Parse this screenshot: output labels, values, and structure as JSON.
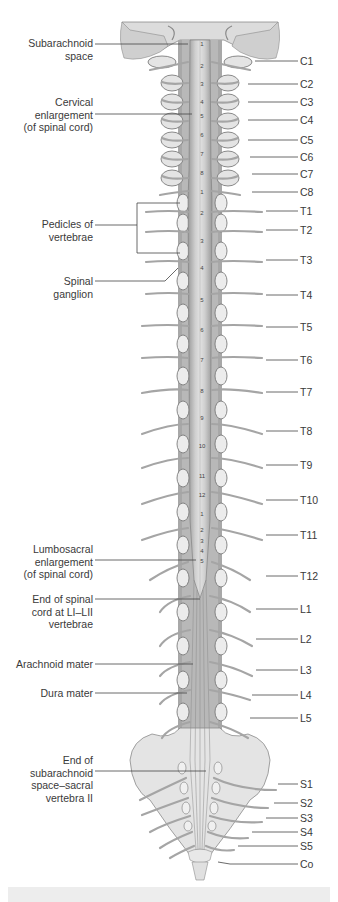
{
  "figure": {
    "colors": {
      "bone": "#e6e6e6",
      "bone_outline": "#8c8c8c",
      "cord": "#c9c9c9",
      "nerve": "#b5b5b5",
      "leader_line": "#444444",
      "bottom_bar": "#ededed"
    },
    "left_labels": [
      {
        "id": "subarachnoid-space",
        "lines": [
          "Subarachnoid",
          "space"
        ]
      },
      {
        "id": "cervical-enlargement",
        "lines": [
          "Cervical",
          "enlargement",
          "(of spinal cord)"
        ]
      },
      {
        "id": "pedicles-of-vertebrae",
        "lines": [
          "Pedicles of",
          "vertebrae"
        ]
      },
      {
        "id": "spinal-ganglion",
        "lines": [
          "Spinal",
          "ganglion"
        ]
      },
      {
        "id": "lumbosacral-enlargement",
        "lines": [
          "Lumbosacral",
          "enlargement",
          "(of spinal cord)"
        ]
      },
      {
        "id": "end-of-spinal-cord",
        "lines": [
          "End of spinal",
          "cord at LI–LII",
          "vertebrae"
        ]
      },
      {
        "id": "arachnoid-mater",
        "lines": [
          "Arachnoid mater"
        ]
      },
      {
        "id": "dura-mater",
        "lines": [
          "Dura mater"
        ]
      },
      {
        "id": "end-of-subarachnoid-space",
        "lines": [
          "End of",
          "subarachnoid",
          "space–sacral",
          "vertebra II"
        ]
      }
    ],
    "right_labels": [
      "C1",
      "C2",
      "C3",
      "C4",
      "C5",
      "C6",
      "C7",
      "C8",
      "T1",
      "T2",
      "T3",
      "T4",
      "T5",
      "T6",
      "T7",
      "T8",
      "T9",
      "T10",
      "T11",
      "T12",
      "L1",
      "L2",
      "L3",
      "L4",
      "L5",
      "S1",
      "S2",
      "S3",
      "S4",
      "S5",
      "Co"
    ],
    "cord_segment_numbers": {
      "cervical": [
        "1",
        "2",
        "3",
        "4",
        "5",
        "6",
        "7",
        "8"
      ],
      "thoracic": [
        "1",
        "2",
        "3",
        "4",
        "5",
        "6",
        "7",
        "8",
        "9",
        "10",
        "11",
        "12"
      ],
      "lumbar": [
        "1",
        "2",
        "3",
        "4",
        "5"
      ]
    }
  }
}
